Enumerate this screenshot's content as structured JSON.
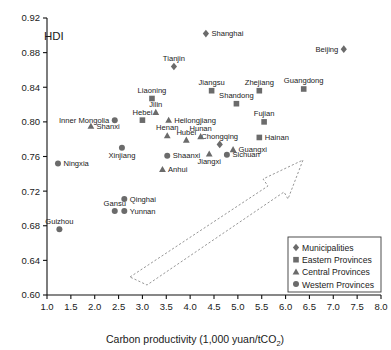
{
  "chart_data": {
    "type": "scatter",
    "title": "",
    "xlabel": "Carbon productivity (1,000 yuan/tCO2)",
    "xlabel_main": "Carbon productivity (1,000 yuan/tCO",
    "xlabel_sub": "2",
    "xlabel_tail": ")",
    "ylabel": "HDI",
    "xlim": [
      1.0,
      8.0
    ],
    "ylim": [
      0.6,
      0.92
    ],
    "xticks": [
      "1.0",
      "1.5",
      "2.0",
      "2.5",
      "3.0",
      "3.5",
      "4.0",
      "4.5",
      "5.0",
      "5.5",
      "6.0",
      "6.5",
      "7.0",
      "7.5",
      "8.0"
    ],
    "xtick_values": [
      1.0,
      1.5,
      2.0,
      2.5,
      3.0,
      3.5,
      4.0,
      4.5,
      5.0,
      5.5,
      6.0,
      6.5,
      7.0,
      7.5,
      8.0
    ],
    "yticks": [
      "0.60",
      "0.64",
      "0.68",
      "0.72",
      "0.76",
      "0.80",
      "0.84",
      "0.88",
      "0.92"
    ],
    "ytick_values": [
      0.6,
      0.64,
      0.68,
      0.72,
      0.76,
      0.8,
      0.84,
      0.88,
      0.92
    ],
    "grid": false,
    "legend_position": "bottom-right",
    "marker_color": "#6b6b6b",
    "series": [
      {
        "name": "Municipalities",
        "marker": "diamond",
        "points": [
          {
            "label": "Shanghai",
            "x": 4.33,
            "y": 0.902,
            "label_pos": "right"
          },
          {
            "label": "Beijing",
            "x": 7.22,
            "y": 0.884,
            "label_pos": "left"
          },
          {
            "label": "Tianjin",
            "x": 3.66,
            "y": 0.864,
            "label_pos": "above"
          },
          {
            "label": "Chongqing",
            "x": 4.62,
            "y": 0.774,
            "label_pos": "above"
          }
        ]
      },
      {
        "name": "Eastern Provinces",
        "marker": "square",
        "points": [
          {
            "label": "Liaoning",
            "x": 3.2,
            "y": 0.827,
            "label_pos": "above"
          },
          {
            "label": "Shandong",
            "x": 4.97,
            "y": 0.821,
            "label_pos": "above"
          },
          {
            "label": "Jiangsu",
            "x": 4.45,
            "y": 0.836,
            "label_pos": "above"
          },
          {
            "label": "Zhejiang",
            "x": 5.45,
            "y": 0.836,
            "label_pos": "above"
          },
          {
            "label": "Guangdong",
            "x": 6.38,
            "y": 0.838,
            "label_pos": "above"
          },
          {
            "label": "Hebei",
            "x": 3.0,
            "y": 0.802,
            "label_pos": "above"
          },
          {
            "label": "Fujian",
            "x": 5.55,
            "y": 0.8,
            "label_pos": "above"
          },
          {
            "label": "Hainan",
            "x": 5.45,
            "y": 0.782,
            "label_pos": "right"
          }
        ]
      },
      {
        "name": "Central Provinces",
        "marker": "triangle",
        "points": [
          {
            "label": "Jilin",
            "x": 3.28,
            "y": 0.811,
            "label_pos": "above"
          },
          {
            "label": "Heilongjiang",
            "x": 3.55,
            "y": 0.802,
            "label_pos": "right"
          },
          {
            "label": "Shanxi",
            "x": 1.92,
            "y": 0.795,
            "label_pos": "right"
          },
          {
            "label": "Henan",
            "x": 3.52,
            "y": 0.784,
            "label_pos": "above"
          },
          {
            "label": "Hubei",
            "x": 3.92,
            "y": 0.779,
            "label_pos": "above"
          },
          {
            "label": "Hunan",
            "x": 4.22,
            "y": 0.783,
            "label_pos": "above"
          },
          {
            "label": "Guangxi",
            "x": 4.9,
            "y": 0.768,
            "label_pos": "right"
          },
          {
            "label": "Jiangxi",
            "x": 4.4,
            "y": 0.763,
            "label_pos": "below"
          },
          {
            "label": "Anhui",
            "x": 3.42,
            "y": 0.745,
            "label_pos": "right"
          }
        ]
      },
      {
        "name": "Western Provinces",
        "marker": "circle",
        "points": [
          {
            "label": "Inner Mongolia",
            "x": 2.42,
            "y": 0.802,
            "label_pos": "left"
          },
          {
            "label": "Xinjiang",
            "x": 2.57,
            "y": 0.77,
            "label_pos": "below"
          },
          {
            "label": "Shaanxi",
            "x": 3.52,
            "y": 0.761,
            "label_pos": "right"
          },
          {
            "label": "Sichuan",
            "x": 4.77,
            "y": 0.762,
            "label_pos": "right"
          },
          {
            "label": "Ningxia",
            "x": 1.23,
            "y": 0.752,
            "label_pos": "right"
          },
          {
            "label": "Qinghai",
            "x": 2.62,
            "y": 0.711,
            "label_pos": "right"
          },
          {
            "label": "Gansu",
            "x": 2.42,
            "y": 0.697,
            "label_pos": "above"
          },
          {
            "label": "Yunnan",
            "x": 2.62,
            "y": 0.697,
            "label_pos": "right"
          },
          {
            "label": "Guizhou",
            "x": 1.26,
            "y": 0.676,
            "label_pos": "above"
          }
        ]
      }
    ],
    "annotations": [
      {
        "type": "dashed-arrow",
        "description": "broad dashed outline arrow pointing up-right"
      }
    ]
  },
  "legend": {
    "items": [
      {
        "label": "Municipalities",
        "marker": "diamond"
      },
      {
        "label": "Eastern Provinces",
        "marker": "square"
      },
      {
        "label": "Central Provinces",
        "marker": "triangle"
      },
      {
        "label": "Western Provinces",
        "marker": "circle"
      }
    ]
  }
}
